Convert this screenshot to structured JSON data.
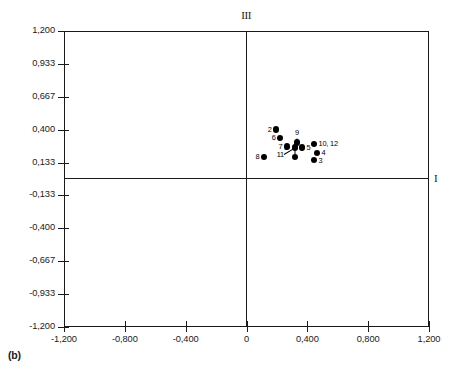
{
  "caption": "(b)",
  "chart_data": {
    "type": "scatter",
    "title": "",
    "subtitle": "",
    "xlabel": "I",
    "ylabel": "III",
    "axis_names": {
      "horizontal": "I",
      "vertical": "III"
    },
    "xlim": [
      -1.2,
      1.2
    ],
    "ylim": [
      -1.2,
      1.2
    ],
    "grid": false,
    "legend": null,
    "xticks": [
      -1.2,
      -0.8,
      -0.4,
      0,
      0.4,
      0.8,
      1.2
    ],
    "xtick_labels": [
      "-1,200",
      "-0,800",
      "-0,400",
      "0",
      "0,400",
      "0,800",
      "1,200"
    ],
    "yticks": [
      1.2,
      0.933,
      0.667,
      0.4,
      0.133,
      -0.133,
      -0.4,
      -0.667,
      -0.933,
      -1.2
    ],
    "ytick_labels": [
      "1,200",
      "0,933",
      "0,667",
      "0,400",
      "0,133",
      "-0,133",
      "-0,400",
      "-0,667",
      "-0,933",
      "-1,200"
    ],
    "point_labels": [
      "1",
      "2",
      "3",
      "4",
      "5",
      "6",
      "7",
      "8",
      "9",
      "10, 12",
      "11"
    ],
    "points": [
      {
        "label": "2",
        "x": 0.195,
        "y": 0.401,
        "label_pos": "left"
      },
      {
        "label": "6",
        "x": 0.221,
        "y": 0.335,
        "label_pos": "left"
      },
      {
        "label": "9",
        "x": 0.332,
        "y": 0.296,
        "label_pos": "above-leader"
      },
      {
        "label": "7",
        "x": 0.266,
        "y": 0.263,
        "label_pos": "left"
      },
      {
        "label": "10, 12",
        "x": 0.444,
        "y": 0.283,
        "label_pos": "right"
      },
      {
        "label": "5",
        "x": 0.365,
        "y": 0.256,
        "label_pos": "right"
      },
      {
        "label": "11",
        "x": 0.319,
        "y": 0.256,
        "label_pos": "below-left-leader"
      },
      {
        "label": "8",
        "x": 0.115,
        "y": 0.178,
        "label_pos": "left"
      },
      {
        "label": "4",
        "x": 0.464,
        "y": 0.21,
        "label_pos": "right"
      },
      {
        "label": "1",
        "x": 0.319,
        "y": 0.178,
        "label_pos": "below-leader"
      },
      {
        "label": "3",
        "x": 0.444,
        "y": 0.151,
        "label_pos": "right"
      }
    ],
    "colors": {
      "marker": "#000000",
      "axis": "#1a1a1a",
      "background": "#ffffff"
    }
  }
}
